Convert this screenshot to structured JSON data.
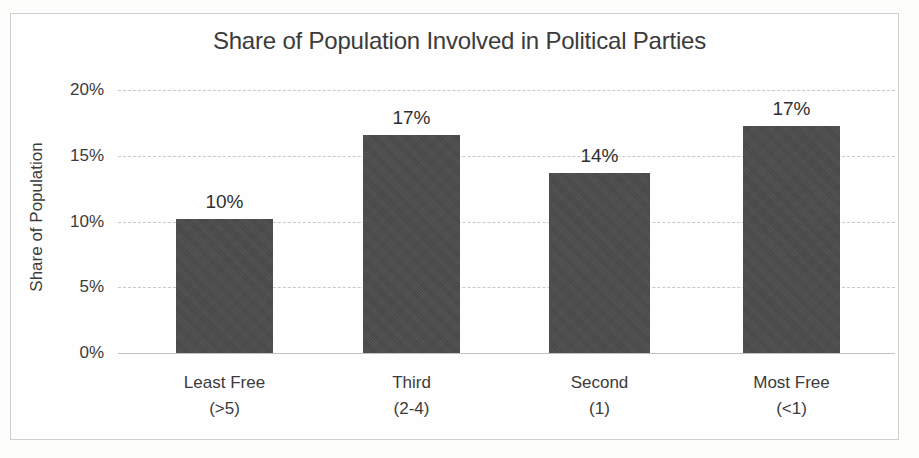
{
  "chart_data": {
    "type": "bar",
    "title": "Share of Population Involved in Political Parties",
    "xlabel": "",
    "ylabel": "Share of Population",
    "categories": [
      "Least Free",
      "Third",
      "Second",
      "Most Free"
    ],
    "category_sublabels": [
      "(>5)",
      "(2-4)",
      "(1)",
      "(<1)"
    ],
    "values": [
      10.2,
      16.6,
      13.7,
      17.3
    ],
    "data_labels": [
      "10%",
      "17%",
      "14%",
      "17%"
    ],
    "ylim": [
      0,
      20
    ],
    "yticks": [
      0,
      5,
      10,
      15,
      20
    ],
    "ytick_labels": [
      "0%",
      "5%",
      "10%",
      "15%",
      "20%"
    ],
    "grid": true,
    "grid_style": "dashed-horizontal",
    "legend": "none",
    "bar_color": "#4b4b4b",
    "grid_color": "#c9c9c9",
    "text_color": "#3b3b3b",
    "border_color": "#cfcfcf",
    "background_color": "#fefefe"
  }
}
